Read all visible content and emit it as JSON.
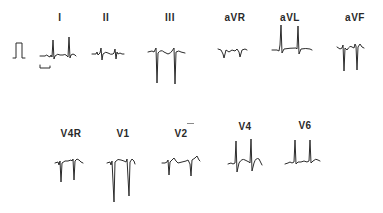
{
  "figure": {
    "type": "12-lead ECG excerpt",
    "background": "#ffffff",
    "trace_color": "#2b2b2b",
    "calibration": {
      "label": "",
      "icon": "calibration-pulse"
    },
    "time_scale_bar": {
      "icon": "time-scale-bracket"
    },
    "limb_leads": [
      {
        "id": "I",
        "label": "I"
      },
      {
        "id": "II",
        "label": "II"
      },
      {
        "id": "III",
        "label": "III"
      },
      {
        "id": "aVR",
        "label": "aVR"
      },
      {
        "id": "aVL",
        "label": "aVL"
      },
      {
        "id": "aVF",
        "label": "aVF"
      }
    ],
    "precordial_leads": [
      {
        "id": "V4R",
        "label": "V4R"
      },
      {
        "id": "V1",
        "label": "V1"
      },
      {
        "id": "V2",
        "label": "V2"
      },
      {
        "id": "V4",
        "label": "V4"
      },
      {
        "id": "V6",
        "label": "V6"
      }
    ]
  }
}
